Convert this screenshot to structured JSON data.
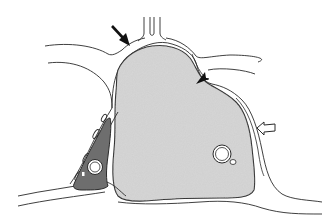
{
  "figure": {
    "type": "histology-schematic",
    "colors": {
      "background": "#ffffff",
      "outline": "#2a2a2a",
      "main_cell_fill": "#cfcfcf",
      "interstitial_cell_fill": "#6e6e6e",
      "lumen_fill": "#ffffff"
    },
    "annotations": [
      {
        "kind": "solid-arrow",
        "location": "top-left of main cell",
        "direction": "down-right"
      },
      {
        "kind": "arrowhead",
        "location": "right shoulder of main cell",
        "direction": "down-left"
      },
      {
        "kind": "open-arrow",
        "location": "right flank of main cell",
        "direction": "left"
      }
    ]
  }
}
